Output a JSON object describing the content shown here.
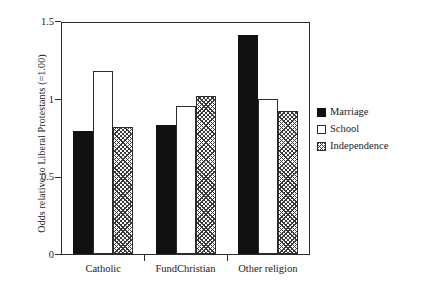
{
  "chart_data": {
    "type": "bar",
    "title": "",
    "xlabel": "",
    "ylabel": "Odds relative to Liberal Protestants (=1.00)",
    "categories": [
      "Catholic",
      "FundChristian",
      "Other religion"
    ],
    "series": [
      {
        "name": "Marriage",
        "values": [
          0.79,
          0.83,
          1.41
        ],
        "color": "#111111",
        "fill": "solid-black"
      },
      {
        "name": "School",
        "values": [
          1.18,
          0.95,
          1.0
        ],
        "color": "#ffffff",
        "fill": "white"
      },
      {
        "name": "Independence",
        "values": [
          0.82,
          1.02,
          0.92
        ],
        "color": "#3a3a3a",
        "fill": "cross-hatch"
      }
    ],
    "ylim": [
      0,
      1.5
    ],
    "yticks": [
      "0",
      "0.5",
      "1",
      "1.5"
    ],
    "ytick_values": [
      0,
      0.5,
      1,
      1.5
    ],
    "grid": false,
    "legend_position": "right"
  },
  "legend": {
    "items": [
      {
        "label": "Marriage",
        "swatch": "solid-black-swatch"
      },
      {
        "label": "School",
        "swatch": "white-swatch"
      },
      {
        "label": "Independence",
        "swatch": "hatched-swatch"
      }
    ]
  }
}
